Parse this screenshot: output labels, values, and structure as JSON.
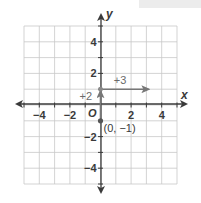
{
  "figure": {
    "x_axis_label": "x",
    "y_axis_label": "y",
    "origin_label": "O",
    "x_range": [
      -5,
      5
    ],
    "y_range": [
      -5,
      5
    ],
    "x_tick_labels": [
      {
        "value": -4,
        "text": "−4"
      },
      {
        "value": -2,
        "text": "−2"
      },
      {
        "value": 2,
        "text": "2"
      },
      {
        "value": 4,
        "text": "4"
      }
    ],
    "y_tick_labels": [
      {
        "value": 4,
        "text": "4"
      },
      {
        "value": 2,
        "text": "2"
      },
      {
        "value": -2,
        "text": "−2"
      },
      {
        "value": -4,
        "text": "−4"
      }
    ],
    "point": {
      "x": 0,
      "y": -1,
      "label": "(0, −1)"
    },
    "rise": {
      "from": [
        0,
        -1
      ],
      "to": [
        0,
        1
      ],
      "label": "+2"
    },
    "run": {
      "from": [
        0,
        1
      ],
      "to": [
        3,
        1
      ],
      "label": "+3"
    },
    "colors": {
      "axis": "#3a3a3a",
      "grid": "#c8c8c8",
      "vector": "#777777",
      "annotation": "#6a6a6a"
    }
  }
}
